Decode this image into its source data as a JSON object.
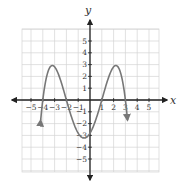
{
  "chart_data": {
    "type": "line",
    "title": "",
    "xlabel": "x",
    "ylabel": "y",
    "xlim": [
      -5.8,
      5.8
    ],
    "ylim": [
      -6,
      6
    ],
    "grid": true,
    "x_ticks": [
      -5,
      -4,
      -3,
      -2,
      -1,
      1,
      2,
      3,
      4,
      5
    ],
    "y_ticks": [
      -5,
      -4,
      -3,
      -2,
      -1,
      1,
      2,
      3,
      4,
      5
    ],
    "x_tick_labels": [
      "−5",
      "−4",
      "−3",
      "−2",
      "−1",
      "1",
      "2",
      "3",
      "4",
      "5"
    ],
    "y_tick_labels": [
      "−5",
      "−4",
      "−3",
      "−2",
      "−1",
      "1",
      "2",
      "3",
      "4",
      "5"
    ],
    "series": [
      {
        "name": "f(x)",
        "description": "Degree-4 polynomial, negative leading coefficient, zeros at x = -4, -2, 1, 3; both ends point down",
        "zeros": [
          -4,
          -2,
          1,
          3
        ],
        "local_maxima": [
          {
            "x": -3,
            "y": 3.3
          },
          {
            "x": 2.1,
            "y": 3.3
          }
        ],
        "local_minima": [
          {
            "x": -0.4,
            "y": -3.3
          }
        ],
        "y_intercept": -2.8,
        "x": [
          -4.18,
          -4,
          -3.5,
          -3,
          -2.5,
          -2,
          -1.5,
          -1,
          -0.5,
          0,
          0.5,
          1,
          1.5,
          2,
          2.5,
          3,
          3.18
        ],
        "values": [
          -4.9,
          0,
          2.5,
          3.3,
          2.3,
          0,
          -2.0,
          -3.1,
          -3.3,
          -2.8,
          -1.6,
          0,
          1.8,
          3.1,
          2.9,
          0,
          -4.9
        ],
        "end_arrows": true,
        "color": "#777777"
      }
    ],
    "colors": {
      "axis": "#222222",
      "grid": "#d4d4d4",
      "curve": "#777777"
    }
  },
  "labels": {
    "x_axis": "x",
    "y_axis": "y"
  }
}
